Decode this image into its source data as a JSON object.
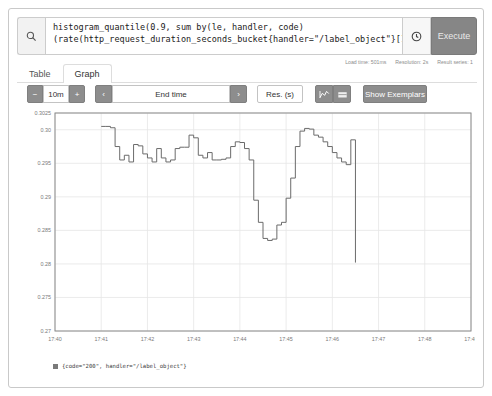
{
  "query": {
    "icon": "search-icon",
    "line1": "histogram_quantile(0.9, sum by(le, handler, code)",
    "line2": "(rate(http_request_duration_seconds_bucket{handler=\"/label_object\"}[1m])))",
    "history_icon": "history-clock-icon",
    "execute_label": "Execute"
  },
  "meta": {
    "load_time": "Load time: 501ms",
    "resolution": "Resolution: 2s",
    "result_series": "Result series: 1"
  },
  "tabs": [
    {
      "label": "Table",
      "active": false
    },
    {
      "label": "Graph",
      "active": true
    }
  ],
  "controls": {
    "minus_label": "−",
    "range_value": "10m",
    "plus_label": "+",
    "prev_label": "‹",
    "end_time_placeholder": "End time",
    "next_label": "›",
    "res_placeholder": "Res. (s)",
    "chart_icon_line": "line-chart-icon",
    "chart_icon_stacked": "stacked-chart-icon",
    "exemplars_label": "Show Exemplars"
  },
  "legend": {
    "swatch_color": "#7a7a7a",
    "label": "{code=\"200\", handler=\"/label_object\"}"
  },
  "chart_data": {
    "type": "line",
    "title": "",
    "xlabel": "",
    "ylabel": "",
    "grid": true,
    "legend_position": "bottom",
    "line_color": "#6b6b6b",
    "xlim": [
      0,
      540
    ],
    "ylim": [
      0.27,
      0.3025
    ],
    "x_ticks": [
      "17:40",
      "17:41",
      "17:42",
      "17:43",
      "17:44",
      "17:45",
      "17:46",
      "17:47",
      "17:48",
      "17:49"
    ],
    "y_ticks": [
      "0.27",
      "0.275",
      "0.28",
      "0.285",
      "0.29",
      "0.295",
      "0.30",
      "0.3025"
    ],
    "y_tick_values": [
      0.27,
      0.275,
      0.28,
      0.285,
      0.29,
      0.295,
      0.3,
      0.3025
    ],
    "series": [
      {
        "name": "{code=\"200\", handler=\"/label_object\"}",
        "x": [
          60,
          66,
          72,
          78,
          84,
          90,
          96,
          102,
          108,
          114,
          120,
          126,
          132,
          138,
          144,
          150,
          156,
          162,
          168,
          174,
          180,
          186,
          192,
          198,
          204,
          210,
          216,
          222,
          228,
          234,
          240,
          246,
          252,
          258,
          264,
          270,
          276,
          282,
          288,
          294,
          300,
          306,
          312,
          318,
          324,
          330,
          336,
          342,
          348,
          354,
          360,
          366,
          372,
          378,
          384,
          390
        ],
        "y": [
          0.3005,
          0.3005,
          0.3003,
          0.2975,
          0.2955,
          0.2962,
          0.2952,
          0.2978,
          0.2976,
          0.2964,
          0.2958,
          0.2952,
          0.2972,
          0.2958,
          0.2952,
          0.2955,
          0.2972,
          0.2974,
          0.2974,
          0.2992,
          0.2988,
          0.2962,
          0.2958,
          0.2966,
          0.2955,
          0.2955,
          0.2956,
          0.2958,
          0.2975,
          0.2982,
          0.2981,
          0.2972,
          0.2955,
          0.2895,
          0.2862,
          0.2838,
          0.2835,
          0.2837,
          0.2858,
          0.2862,
          0.2898,
          0.2928,
          0.2975,
          0.2998,
          0.3002,
          0.3001,
          0.2992,
          0.2989,
          0.2982,
          0.2975,
          0.2966,
          0.2958,
          0.2952,
          0.2948,
          0.2985,
          0.2802
        ]
      }
    ],
    "annotations": [
      "steady high plateau near 0.3005 until 17:41",
      "oscillating band between 0.295 and 0.299 from 17:41 to 17:44",
      "sharp dip to minimum 0.2835 around 17:44",
      "recovery peak 0.3002 around 17:45",
      "final vertical drop to 0.2802 just before 17:47"
    ]
  }
}
